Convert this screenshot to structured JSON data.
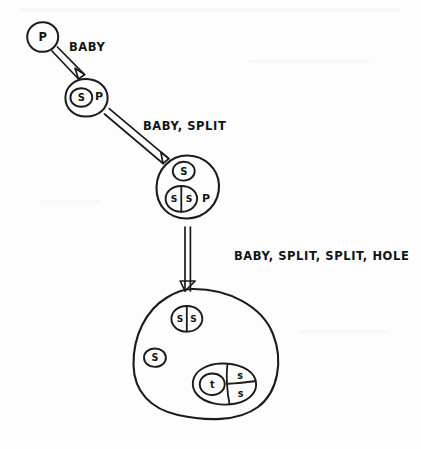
{
  "canvas": {
    "width": 421,
    "height": 449,
    "background": "#fdfdfd",
    "ink_color": "#1b1b1b",
    "style": "hand-drawn sketch"
  },
  "diagram": {
    "type": "state-transition-sketch",
    "title": "",
    "nodes": [
      {
        "id": "node-1",
        "name": "state-p",
        "shape": "circle",
        "outer_label": "",
        "contents": [
          {
            "glyph": "P",
            "kind": "free-letter"
          }
        ]
      },
      {
        "id": "node-2",
        "name": "state-s-p",
        "shape": "circle",
        "outer_label": "",
        "contents": [
          {
            "glyph": "S",
            "kind": "circled-letter"
          },
          {
            "glyph": "P",
            "kind": "free-letter"
          }
        ]
      },
      {
        "id": "node-3",
        "name": "state-s-ss-p",
        "shape": "blob",
        "outer_label": "",
        "contents": [
          {
            "glyph": "S",
            "kind": "circled-letter"
          },
          {
            "glyph": "S|S",
            "kind": "split-circle",
            "left": "S",
            "right": "S"
          },
          {
            "glyph": "P",
            "kind": "free-letter"
          }
        ]
      },
      {
        "id": "node-4",
        "name": "state-final-blob",
        "shape": "blob",
        "outer_label": "",
        "contents": [
          {
            "glyph": "S|S",
            "kind": "split-circle",
            "left": "S",
            "right": "S"
          },
          {
            "glyph": "S",
            "kind": "circled-letter"
          },
          {
            "glyph": "t / s / s",
            "kind": "compound-blob",
            "parts": [
              "t",
              "s",
              "s"
            ]
          }
        ]
      }
    ],
    "edges": [
      {
        "id": "edge-1",
        "name": "edge-baby",
        "from": "node-1",
        "to": "node-2",
        "label": "BABY"
      },
      {
        "id": "edge-2",
        "name": "edge-baby-split",
        "from": "node-2",
        "to": "node-3",
        "label": "BABY, SPLIT"
      },
      {
        "id": "edge-3",
        "name": "edge-baby-split-split-hole",
        "from": "node-3",
        "to": "node-4",
        "label": "BABY, SPLIT, SPLIT, HOLE"
      }
    ]
  },
  "glyphs": {
    "n1_p": "P",
    "n2_s": "S",
    "n2_p": "P",
    "n3_s": "S",
    "n3_ss_left": "S",
    "n3_ss_right": "S",
    "n3_p": "P",
    "n4_ss_left": "S",
    "n4_ss_right": "S",
    "n4_s": "S",
    "n4_t": "t",
    "n4_s_top": "s",
    "n4_s_bottom": "s"
  },
  "labels": {
    "edge1": "BABY",
    "edge2": "BABY, SPLIT",
    "edge3": "BABY, SPLIT, SPLIT, HOLE"
  }
}
